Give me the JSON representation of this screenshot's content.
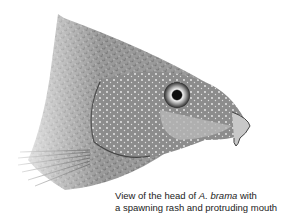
{
  "figure": {
    "colors": {
      "background": "#ffffff",
      "scales": "#8a8a8a",
      "dark": "#3a3a3a",
      "light": "#d8d8d8"
    }
  },
  "caption": {
    "line1_prefix": "View of the head of ",
    "line1_species": "A. brama",
    "line1_suffix": " with",
    "line2": "a spawning rash and protruding mouth"
  }
}
